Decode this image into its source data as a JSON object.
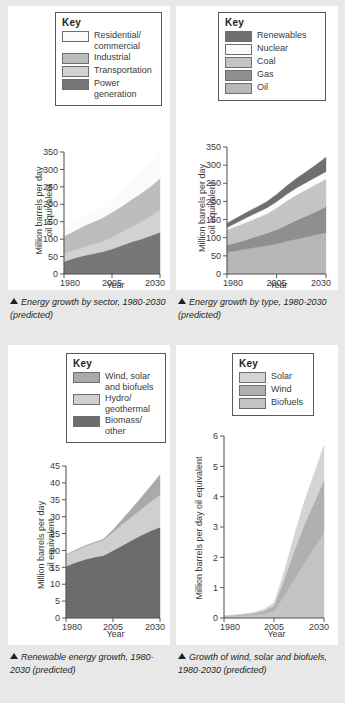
{
  "page": {
    "background": "#e8e8e8",
    "panel_background": "#ffffff",
    "key_title": "Key"
  },
  "figures": [
    {
      "id": "fig1",
      "key_title": "Key",
      "key_items": [
        {
          "label": "Residential/\ncommercial",
          "color": "#fbfbfa"
        },
        {
          "label": "Industrial",
          "color": "#bdbdbd"
        },
        {
          "label": "Transportation",
          "color": "#d2d2d0"
        },
        {
          "label": "Power\ngeneration",
          "color": "#77777a"
        }
      ],
      "caption": "Energy growth by sector, 1980-2030 (predicted)",
      "chart_data": {
        "type": "area",
        "title": "Energy growth by sector, 1980-2030 (predicted)",
        "xlabel": "Year",
        "ylabel": "Million barrels per day oil equivalent",
        "xlim": [
          1980,
          2030
        ],
        "ylim": [
          0,
          350
        ],
        "yticks": [
          0,
          50,
          100,
          150,
          200,
          250,
          300,
          350
        ],
        "xticks": [
          1980,
          2005,
          2030
        ],
        "grid": false,
        "legend": "top, boxed key",
        "stacked": true,
        "x": [
          1980,
          1985,
          1990,
          1995,
          2000,
          2005,
          2010,
          2015,
          2020,
          2025,
          2030
        ],
        "series": [
          {
            "name": "Power generation",
            "color": "#77777a",
            "values": [
              36,
              45,
              52,
              58,
              64,
              72,
              82,
              92,
              100,
              110,
              120
            ]
          },
          {
            "name": "Transportation",
            "color": "#d2d2d0",
            "values": [
              22,
              23,
              25,
              27,
              29,
              33,
              38,
              43,
              49,
              55,
              64
            ]
          },
          {
            "name": "Industrial",
            "color": "#bdbdbd",
            "values": [
              50,
              55,
              60,
              64,
              68,
              72,
              74,
              78,
              82,
              86,
              90
            ]
          },
          {
            "name": "Residential/commercial",
            "color": "#fbfbfa",
            "values": [
              20,
              22,
              26,
              30,
              34,
              38,
              44,
              52,
              62,
              72,
              86
            ]
          }
        ],
        "totals": [
          128,
          145,
          163,
          179,
          195,
          215,
          238,
          265,
          293,
          323,
          360
        ]
      }
    },
    {
      "id": "fig2",
      "key_title": "Key",
      "key_items": [
        {
          "label": "Renewables",
          "color": "#6e6f72"
        },
        {
          "label": "Nuclear",
          "color": "#fbfbfa"
        },
        {
          "label": "Coal",
          "color": "#c4c4c2"
        },
        {
          "label": "Gas",
          "color": "#8e8f91"
        },
        {
          "label": "Oil",
          "color": "#b7b7b5"
        }
      ],
      "caption": "Energy growth by type, 1980-2030 (predicted)",
      "chart_data": {
        "type": "area",
        "title": "Energy growth by type, 1980-2030 (predicted)",
        "xlabel": "Year",
        "ylabel": "Million barrels per day oil equivalent",
        "xlim": [
          1980,
          2030
        ],
        "ylim": [
          0,
          350
        ],
        "yticks": [
          0,
          50,
          100,
          150,
          200,
          250,
          300,
          350
        ],
        "xticks": [
          1980,
          2005,
          2030
        ],
        "grid": false,
        "legend": "top, boxed key",
        "stacked": true,
        "x": [
          1980,
          1985,
          1990,
          1995,
          2000,
          2005,
          2010,
          2015,
          2020,
          2025,
          2030
        ],
        "series": [
          {
            "name": "Oil",
            "color": "#b7b7b5",
            "values": [
              60,
              64,
              69,
              74,
              78,
              83,
              90,
              96,
              102,
              108,
              114
            ]
          },
          {
            "name": "Gas",
            "color": "#8e8f91",
            "values": [
              20,
              23,
              26,
              30,
              34,
              39,
              45,
              52,
              58,
              64,
              72
            ]
          },
          {
            "name": "Coal",
            "color": "#c4c4c2",
            "values": [
              42,
              45,
              48,
              50,
              54,
              60,
              66,
              70,
              73,
              75,
              76
            ]
          },
          {
            "name": "Nuclear",
            "color": "#fbfbfa",
            "values": [
              6,
              10,
              13,
              15,
              16,
              17,
              18,
              19,
              19,
              20,
              20
            ]
          },
          {
            "name": "Renewables",
            "color": "#6e6f72",
            "values": [
              12,
              13,
              14,
              15,
              17,
              20,
              23,
              26,
              30,
              34,
              40
            ]
          }
        ],
        "totals": [
          140,
          155,
          170,
          184,
          199,
          219,
          242,
          263,
          282,
          301,
          322
        ]
      }
    },
    {
      "id": "fig3",
      "key_title": "Key",
      "key_items": [
        {
          "label": "Wind, solar\nand biofuels",
          "color": "#a9a9a7"
        },
        {
          "label": "Hydro/\ngeothermal",
          "color": "#cfcfcd"
        },
        {
          "label": "Biomass/\nother",
          "color": "#6b6c6e"
        }
      ],
      "caption": "Renewable energy growth, 1980-2030 (predicted)",
      "chart_data": {
        "type": "area",
        "title": "Renewable energy growth, 1980-2030 (predicted)",
        "xlabel": "Year",
        "ylabel": "Million barrels per day oil equivalent",
        "xlim": [
          1980,
          2030
        ],
        "ylim": [
          0,
          45
        ],
        "yticks": [
          0,
          5,
          10,
          15,
          20,
          25,
          30,
          35,
          40,
          45
        ],
        "xticks": [
          1980,
          2005,
          2030
        ],
        "grid": false,
        "legend": "top, boxed key",
        "stacked": true,
        "x": [
          1980,
          1985,
          1990,
          1995,
          2000,
          2005,
          2010,
          2015,
          2020,
          2025,
          2030
        ],
        "series": [
          {
            "name": "Biomass/other",
            "color": "#6b6c6e",
            "values": [
              15.3,
              16.4,
              17.3,
              18.0,
              18.5,
              20.0,
              21.5,
              23.0,
              24.5,
              25.8,
              26.9
            ]
          },
          {
            "name": "Hydro/geothermal",
            "color": "#cfcfcd",
            "values": [
              3.4,
              3.6,
              3.9,
              4.2,
              4.6,
              5.4,
              6.3,
              7.0,
              7.7,
              8.6,
              9.5
            ]
          },
          {
            "name": "Wind, solar and biofuels",
            "color": "#a9a9a7",
            "values": [
              0.1,
              0.1,
              0.2,
              0.2,
              0.3,
              0.7,
              1.4,
              2.4,
              3.5,
              4.6,
              6.0
            ]
          }
        ],
        "totals": [
          18.8,
          20.1,
          21.4,
          22.4,
          23.4,
          26.1,
          29.2,
          32.4,
          35.7,
          39.0,
          42.4
        ]
      }
    },
    {
      "id": "fig4",
      "key_title": "Key",
      "key_items": [
        {
          "label": "Solar",
          "color": "#d4d4d2"
        },
        {
          "label": "Wind",
          "color": "#b0b0ae"
        },
        {
          "label": "Biofuels",
          "color": "#c3c3c1"
        }
      ],
      "caption": "Growth of wind, solar and biofuels, 1980-2030 (predicted)",
      "chart_data": {
        "type": "area",
        "title": "Growth of wind, solar and biofuels, 1980-2030 (predicted)",
        "xlabel": "Year",
        "ylabel": "Million barrels per day oil equivalent",
        "xlim": [
          1980,
          2030
        ],
        "ylim": [
          0,
          6
        ],
        "yticks": [
          0,
          1,
          2,
          3,
          4,
          5,
          6
        ],
        "xticks": [
          1980,
          2005,
          2030
        ],
        "grid": false,
        "legend": "top, boxed key",
        "stacked": true,
        "x": [
          1980,
          1985,
          1990,
          1995,
          2000,
          2005,
          2010,
          2015,
          2020,
          2025,
          2030
        ],
        "series": [
          {
            "name": "Biofuels",
            "color": "#c3c3c1",
            "values": [
              0.05,
              0.06,
              0.08,
              0.1,
              0.14,
              0.22,
              0.7,
              1.25,
              1.8,
              2.3,
              2.8
            ]
          },
          {
            "name": "Wind",
            "color": "#b0b0ae",
            "values": [
              0.02,
              0.03,
              0.04,
              0.06,
              0.1,
              0.18,
              0.55,
              0.95,
              1.25,
              1.5,
              1.75
            ]
          },
          {
            "name": "Solar",
            "color": "#d4d4d2",
            "values": [
              0.01,
              0.01,
              0.02,
              0.03,
              0.05,
              0.1,
              0.25,
              0.5,
              0.75,
              0.95,
              1.15
            ]
          }
        ],
        "totals": [
          0.08,
          0.1,
          0.14,
          0.19,
          0.29,
          0.5,
          1.5,
          2.7,
          3.8,
          4.75,
          5.7
        ]
      }
    }
  ]
}
